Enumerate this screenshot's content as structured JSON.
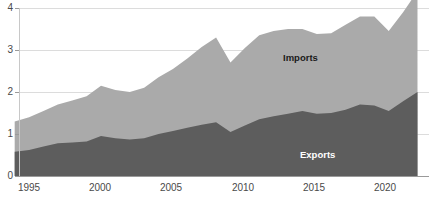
{
  "chart_data": {
    "type": "area",
    "stacked": true,
    "title": "",
    "subtitle": "",
    "xlabel": "",
    "ylabel": "",
    "xlim": [
      1994.3,
      2022.8
    ],
    "ylim": [
      0,
      4.2
    ],
    "grid": true,
    "grid_axis": "y",
    "legend_position": "inline-annotation",
    "x": [
      1994,
      1995,
      1996,
      1997,
      1998,
      1999,
      2000,
      2001,
      2002,
      2003,
      2004,
      2005,
      2006,
      2007,
      2008,
      2009,
      2010,
      2011,
      2012,
      2013,
      2014,
      2015,
      2016,
      2017,
      2018,
      2019,
      2020,
      2021,
      2022
    ],
    "x_tick_values": [
      1995,
      2000,
      2005,
      2010,
      2015,
      2020
    ],
    "x_tick_labels": [
      "1995",
      "2000",
      "2005",
      "2010",
      "2015",
      "2020"
    ],
    "y_tick_values": [
      0,
      1,
      2,
      3,
      4
    ],
    "y_tick_labels": [
      "0",
      "1",
      "2",
      "3",
      "4"
    ],
    "series": [
      {
        "name": "Exports",
        "color": "#5d5d5d",
        "label": "Exports",
        "label_color": "#ffffff",
        "values": [
          0.58,
          0.62,
          0.7,
          0.78,
          0.8,
          0.82,
          0.95,
          0.9,
          0.87,
          0.9,
          1.0,
          1.07,
          1.15,
          1.22,
          1.28,
          1.05,
          1.2,
          1.35,
          1.42,
          1.48,
          1.55,
          1.48,
          1.5,
          1.58,
          1.7,
          1.68,
          1.55,
          1.78,
          2.0
        ]
      },
      {
        "name": "Imports",
        "color": "#aaaaaa",
        "label": "Imports",
        "label_color": "#1a1a1a",
        "values": [
          0.72,
          0.78,
          0.85,
          0.92,
          1.0,
          1.08,
          1.2,
          1.15,
          1.13,
          1.2,
          1.35,
          1.48,
          1.65,
          1.85,
          2.02,
          1.65,
          1.85,
          2.0,
          2.03,
          2.02,
          1.95,
          1.9,
          1.9,
          2.02,
          2.1,
          2.12,
          1.9,
          2.12,
          2.4
        ]
      }
    ],
    "totals": [
      1.3,
      1.4,
      1.55,
      1.7,
      1.8,
      1.9,
      2.15,
      2.05,
      2.0,
      2.1,
      2.35,
      2.55,
      2.8,
      3.07,
      3.3,
      2.7,
      3.05,
      3.35,
      3.45,
      3.5,
      3.5,
      3.38,
      3.4,
      3.6,
      3.8,
      3.8,
      3.45,
      3.9,
      4.4
    ]
  },
  "axis": {
    "y_labels": [
      "4",
      "3",
      "2",
      "1",
      "0"
    ],
    "x_labels": [
      "1995",
      "2000",
      "2005",
      "2010",
      "2015",
      "2020"
    ]
  },
  "annotations": {
    "imports_label": "Imports",
    "exports_label": "Exports"
  },
  "colors": {
    "exports": "#5d5d5d",
    "imports": "#aaaaaa",
    "grid": "#dcdcdc",
    "axis_text": "#4a4a4a",
    "background": "#ffffff"
  }
}
